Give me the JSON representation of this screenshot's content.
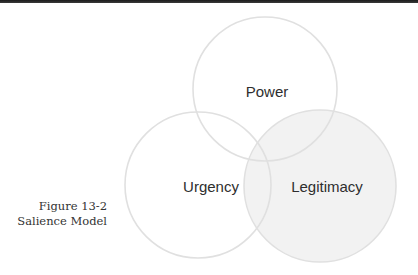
{
  "figure": {
    "caption_number": "Figure 13-2",
    "caption_title": "Salience Model"
  },
  "diagram": {
    "type": "venn",
    "circles": [
      {
        "id": "power",
        "label": "Power",
        "filled": false
      },
      {
        "id": "urgency",
        "label": "Urgency",
        "filled": false
      },
      {
        "id": "legitimacy",
        "label": "Legitimacy",
        "filled": true
      }
    ]
  },
  "colors": {
    "stroke": "#e0e0e0",
    "legitimacy_fill": "#f2f2f2",
    "label_text": "#2e2e2e",
    "caption_text": "#333333",
    "top_bar": "#222222"
  }
}
